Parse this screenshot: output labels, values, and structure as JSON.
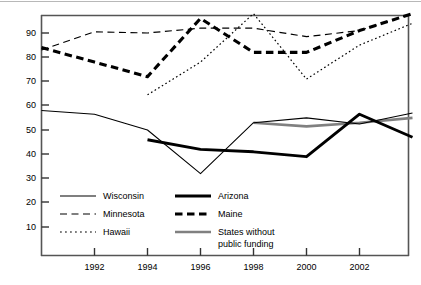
{
  "chart_data": {
    "type": "line",
    "title": "",
    "subtitle": "",
    "xlabel": "",
    "ylabel": "",
    "xlim": [
      1990,
      2004
    ],
    "ylim": [
      0,
      100
    ],
    "grid": false,
    "legend_position": "inside-bottom-left",
    "x_ticks": [
      1992,
      1994,
      1996,
      1998,
      2000,
      2002
    ],
    "x_tick_labels": [
      "1992",
      "1994",
      "1996",
      "1998",
      "2000",
      "2002"
    ],
    "y_ticks": [
      10,
      20,
      30,
      40,
      50,
      60,
      70,
      80,
      90
    ],
    "y_tick_labels": [
      "10",
      "20",
      "30",
      "40",
      "50",
      "60",
      "70",
      "80",
      "90"
    ],
    "series": [
      {
        "name": "Wisconsin",
        "style": "thin-solid",
        "color": "#000000",
        "x": [
          1990,
          1992,
          1994,
          1996,
          1998,
          2000,
          2002,
          2004
        ],
        "values": [
          58,
          56.5,
          50,
          32,
          53,
          55,
          52.5,
          57
        ]
      },
      {
        "name": "Minnesota",
        "style": "dashed",
        "color": "#000000",
        "x": [
          1990,
          1992,
          1994,
          1996,
          1998,
          2000,
          2002,
          2004
        ],
        "values": [
          83,
          90.5,
          90,
          92,
          92,
          88.5,
          91,
          98
        ]
      },
      {
        "name": "Hawaii",
        "style": "dotted",
        "color": "#000000",
        "x": [
          1994,
          1996,
          1998,
          2000,
          2002,
          2004
        ],
        "values": [
          64.5,
          78,
          98,
          71,
          85,
          94
        ]
      },
      {
        "name": "Arizona",
        "style": "thick-solid",
        "color": "#000000",
        "x": [
          1994,
          1996,
          1998,
          2000,
          2002,
          2004
        ],
        "values": [
          46,
          42,
          41,
          39,
          56.5,
          47
        ]
      },
      {
        "name": "Maine",
        "style": "thick-dashed",
        "color": "#000000",
        "x": [
          1990,
          1992,
          1994,
          1996,
          1998,
          2000,
          2002,
          2004
        ],
        "values": [
          84,
          78,
          72,
          96,
          82,
          82,
          91,
          98
        ]
      },
      {
        "name": "States without public funding",
        "style": "medium-gray-solid",
        "color": "#808080",
        "x": [
          1998,
          2000,
          2002,
          2004
        ],
        "values": [
          53,
          51.5,
          53,
          55
        ]
      }
    ]
  },
  "legend": {
    "entries": [
      {
        "label": "Wisconsin",
        "swatch": "thin-solid-swatch"
      },
      {
        "label": "Minnesota",
        "swatch": "dashed-swatch"
      },
      {
        "label": "Hawaii",
        "swatch": "dotted-swatch"
      },
      {
        "label": "Arizona",
        "swatch": "thick-solid-swatch"
      },
      {
        "label": "Maine",
        "swatch": "thick-dashed-swatch"
      },
      {
        "label": "States without",
        "label2": "public funding",
        "swatch": "gray-solid-swatch"
      }
    ]
  }
}
